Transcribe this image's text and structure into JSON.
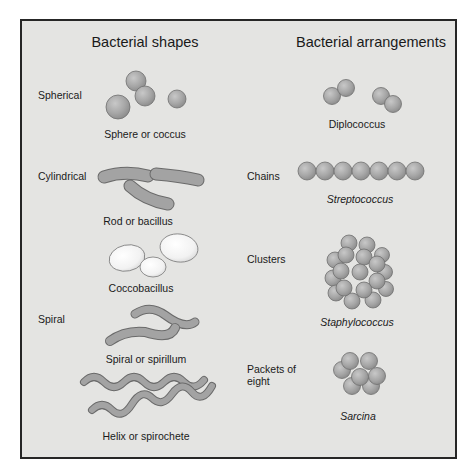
{
  "left_column": {
    "title": "Bacterial shapes",
    "categories": [
      {
        "label": "Spherical"
      },
      {
        "label": "Cylindrical"
      },
      {
        "label": "Spiral"
      }
    ],
    "shapes": [
      {
        "caption": "Sphere or coccus"
      },
      {
        "caption": "Rod or bacillus"
      },
      {
        "caption": "Coccobacillus"
      },
      {
        "caption": "Spiral or spirillum"
      },
      {
        "caption": "Helix or spirochete"
      }
    ]
  },
  "right_column": {
    "title": "Bacterial arrangements",
    "arrangements": [
      {
        "label": "",
        "caption": "Diplococcus"
      },
      {
        "label": "Chains",
        "caption": "Streptococcus"
      },
      {
        "label": "Clusters",
        "caption": "Staphylococcus"
      },
      {
        "label_line1": "Packets of",
        "label_line2": "eight",
        "caption": "Sarcina"
      }
    ]
  },
  "colors": {
    "panel_background": "#e4e4e2",
    "border": "#262626",
    "cell_fill": "#a8a8a8",
    "cell_stroke": "#6e6e6e",
    "coccobacillus_fill": "#f4f4f4"
  }
}
